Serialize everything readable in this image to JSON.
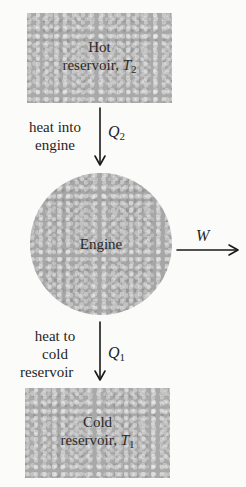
{
  "diagram": {
    "type": "heat-engine-schematic",
    "nodes": {
      "hot_reservoir": {
        "line1": "Hot",
        "line2_prefix": "reservoir, ",
        "temp_symbol": "T",
        "temp_sub": "2"
      },
      "engine": {
        "label": "Engine"
      },
      "cold_reservoir": {
        "line1": "Cold",
        "line2_prefix": "reservoir, ",
        "temp_symbol": "T",
        "temp_sub": "1"
      }
    },
    "flows": {
      "heat_in": {
        "caption_line1": "heat into",
        "caption_line2": "engine",
        "symbol": "Q",
        "sub": "2"
      },
      "work_out": {
        "symbol": "W"
      },
      "heat_out": {
        "caption_line1": "heat to",
        "caption_line2": "cold",
        "caption_line3": "reservoir",
        "symbol": "Q",
        "sub": "1"
      }
    },
    "colors": {
      "fill": "#a9a9a9",
      "text": "#1f1f1f",
      "background": "#fbfbfa"
    }
  }
}
